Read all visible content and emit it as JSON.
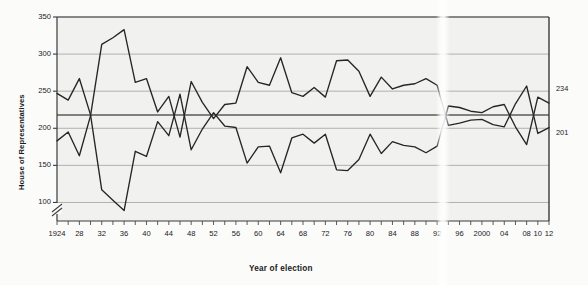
{
  "chart_data": {
    "type": "line",
    "title": "",
    "xlabel": "Year of election",
    "ylabel": "House of Representatives",
    "ylim": [
      75,
      350
    ],
    "y_axis_break": true,
    "y_ticks": [
      100,
      150,
      200,
      250,
      300,
      350
    ],
    "y_tick_labels": [
      "100",
      "150",
      "200",
      "250",
      "300",
      "350"
    ],
    "grid": true,
    "reference_line": 218,
    "xlim": [
      1924,
      2012
    ],
    "x_minor_step": 2,
    "x_tick_labels": [
      "1924",
      "28",
      "32",
      "36",
      "40",
      "44",
      "48",
      "52",
      "56",
      "60",
      "64",
      "68",
      "72",
      "76",
      "80",
      "84",
      "88",
      "92",
      "96",
      "2000",
      "04",
      "08",
      "10",
      "12"
    ],
    "x_tick_years": [
      1924,
      1928,
      1932,
      1936,
      1940,
      1944,
      1948,
      1952,
      1956,
      1960,
      1964,
      1968,
      1972,
      1976,
      1980,
      1984,
      1988,
      1992,
      1996,
      2000,
      2004,
      2008,
      2010,
      2012
    ],
    "legend_position": "inline-annotations",
    "annotations": [
      {
        "name": "democrats-label",
        "text": "Democrats",
        "x": 1936.5,
        "y": 283
      },
      {
        "name": "republicans-label",
        "text": "Republicans",
        "x": 1935.0,
        "y": 133
      },
      {
        "name": "democrats-end-value",
        "text": "234",
        "x": 2012,
        "y": 234
      },
      {
        "name": "republicans-end-value",
        "text": "201",
        "x": 2012,
        "y": 201
      }
    ],
    "x": [
      1924,
      1926,
      1928,
      1930,
      1932,
      1934,
      1936,
      1938,
      1940,
      1942,
      1944,
      1946,
      1948,
      1950,
      1952,
      1954,
      1956,
      1958,
      1960,
      1962,
      1964,
      1966,
      1968,
      1970,
      1972,
      1974,
      1976,
      1978,
      1980,
      1982,
      1984,
      1986,
      1988,
      1990,
      1992,
      1994,
      1996,
      1998,
      2000,
      2002,
      2004,
      2006,
      2008,
      2010,
      2012
    ],
    "series": [
      {
        "name": "Democrats",
        "color": "#262626",
        "values": [
          183,
          195,
          163,
          217,
          313,
          322,
          333,
          262,
          267,
          222,
          243,
          188,
          263,
          235,
          213,
          232,
          234,
          283,
          262,
          258,
          295,
          248,
          243,
          255,
          242,
          291,
          292,
          277,
          243,
          269,
          253,
          258,
          260,
          267,
          258,
          204,
          207,
          211,
          212,
          205,
          202,
          233,
          257,
          193,
          201
        ]
      },
      {
        "name": "Republicans",
        "color": "#262626",
        "values": [
          247,
          238,
          267,
          218,
          117,
          103,
          89,
          169,
          162,
          209,
          190,
          246,
          171,
          199,
          221,
          203,
          201,
          153,
          175,
          176,
          140,
          187,
          192,
          180,
          192,
          144,
          143,
          158,
          192,
          166,
          182,
          177,
          175,
          167,
          176,
          230,
          228,
          223,
          221,
          229,
          232,
          202,
          178,
          242,
          234
        ]
      }
    ],
    "note": "Series values map to on-chart traces: upper trace at the right end is 234 (Republicans), lower is 201 (Democrats)."
  },
  "axis": {
    "ylabel": "House of Representatives",
    "xlabel": "Year of election"
  },
  "colors": {
    "line": "#262626",
    "grid": "#a9a9a9",
    "reference": "#5a5a5a",
    "frame": "#3a3a3a",
    "plot_bg": "#f1f1f0",
    "text": "#1a1a1a"
  }
}
